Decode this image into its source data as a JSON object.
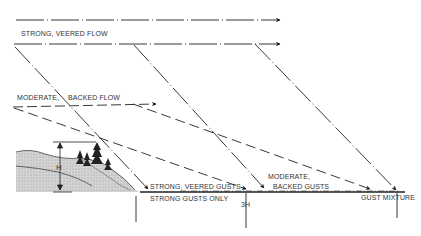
{
  "diagram": {
    "type": "meteorological-flow-diagram",
    "labels": {
      "strong_veered_flow": "STRONG, VEERED FLOW",
      "moderate": "MODERATE,",
      "backed_flow": "BACKED FLOW",
      "strong_veered_gusts": "STRONG,  VEERED GUSTS",
      "strong_gusts_only": "STRONG GUSTS ONLY",
      "moderate_gusts": "MODERATE,",
      "backed_gusts": "BACKED GUSTS",
      "gust_mixture": "GUST MIXTURE",
      "height_label": "H",
      "distance_label": "3H"
    },
    "colors": {
      "line": "#222222",
      "terrain_fill": "#c8c8c8",
      "background": "#ffffff"
    }
  }
}
